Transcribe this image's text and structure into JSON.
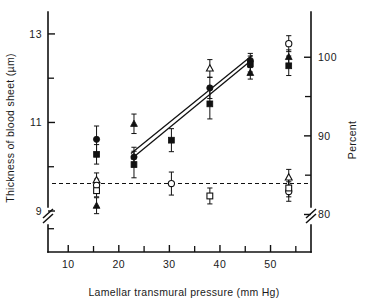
{
  "chart_data": {
    "type": "scatter",
    "title": "",
    "xlabel": "Lamellar transmural pressure (mm Hg)",
    "ylabel": "Thickness of blood sheet (µm)",
    "y2label": "Percent",
    "xlim": [
      6,
      58
    ],
    "ylim": [
      8.3,
      13.45
    ],
    "y2lim": [
      76.5,
      105.5
    ],
    "grid": false,
    "legend": "none",
    "axis_break": {
      "left": true,
      "right": true,
      "note": "broken vertical axes near baseline"
    },
    "xticks": [
      10,
      20,
      30,
      40,
      50
    ],
    "xticklabels": [
      "10",
      "20",
      "30",
      "40",
      "50"
    ],
    "xticks_minor": [
      15,
      25,
      35,
      45,
      55
    ],
    "yticks": [
      9,
      11,
      13
    ],
    "yticklabels": [
      "9",
      "11",
      "13"
    ],
    "yticks_minor": [
      10,
      12,
      8.6
    ],
    "y2ticks": [
      80,
      90,
      100
    ],
    "y2ticklabels": [
      "80",
      "90",
      "100"
    ],
    "y2ticks_minor": [
      85,
      95
    ],
    "baseline": {
      "value": 9.62,
      "style": "dashed",
      "label": ""
    },
    "series": [
      {
        "name": "filled-circle",
        "marker": "filled-circle",
        "points": [
          {
            "x": 15.6,
            "y": 10.62,
            "err": 0.3
          },
          {
            "x": 23.0,
            "y": 10.22,
            "err": 0.22
          },
          {
            "x": 38.0,
            "y": 11.78,
            "err": 0.24
          },
          {
            "x": 46.0,
            "y": 12.4,
            "err": 0.16
          }
        ]
      },
      {
        "name": "filled-square",
        "marker": "filled-square",
        "points": [
          {
            "x": 15.6,
            "y": 10.28,
            "err": 0.22
          },
          {
            "x": 23.0,
            "y": 10.05,
            "err": 0.3
          },
          {
            "x": 30.4,
            "y": 10.6,
            "err": 0.26
          },
          {
            "x": 38.0,
            "y": 11.42,
            "err": 0.34
          },
          {
            "x": 46.0,
            "y": 12.32,
            "err": 0.18
          },
          {
            "x": 53.6,
            "y": 12.28,
            "err": 0.22
          }
        ]
      },
      {
        "name": "filled-triangle",
        "marker": "filled-triangle",
        "points": [
          {
            "x": 15.6,
            "y": 9.12,
            "err": 0.18
          },
          {
            "x": 23.0,
            "y": 10.97,
            "err": 0.22
          },
          {
            "x": 46.0,
            "y": 12.12,
            "err": 0.14
          },
          {
            "x": 53.6,
            "y": 12.48,
            "err": 0.16
          }
        ]
      },
      {
        "name": "open-triangle",
        "marker": "open-triangle",
        "points": [
          {
            "x": 15.6,
            "y": 9.7,
            "err": 0.16
          },
          {
            "x": 38.0,
            "y": 12.22,
            "err": 0.2
          },
          {
            "x": 53.6,
            "y": 9.76,
            "err": 0.18
          }
        ]
      },
      {
        "name": "open-circle",
        "marker": "open-circle",
        "points": [
          {
            "x": 15.6,
            "y": 9.58,
            "err": 0.14
          },
          {
            "x": 30.4,
            "y": 9.62,
            "err": 0.26
          },
          {
            "x": 53.6,
            "y": 12.78,
            "err": 0.18
          },
          {
            "x": 53.6,
            "y": 9.44,
            "err": 0.22
          }
        ]
      },
      {
        "name": "open-square",
        "marker": "open-square",
        "points": [
          {
            "x": 15.6,
            "y": 9.46,
            "err": 0.14
          },
          {
            "x": 38.0,
            "y": 9.34,
            "err": 0.18
          },
          {
            "x": 53.6,
            "y": 9.52,
            "err": 0.2
          }
        ]
      }
    ],
    "fit_lines": [
      {
        "name": "regression-line-upper",
        "x0": 22.4,
        "y0": 10.3,
        "x1": 46.4,
        "y1": 12.52
      },
      {
        "name": "regression-line-lower",
        "x0": 22.4,
        "y0": 10.17,
        "x1": 46.4,
        "y1": 12.42
      }
    ]
  }
}
